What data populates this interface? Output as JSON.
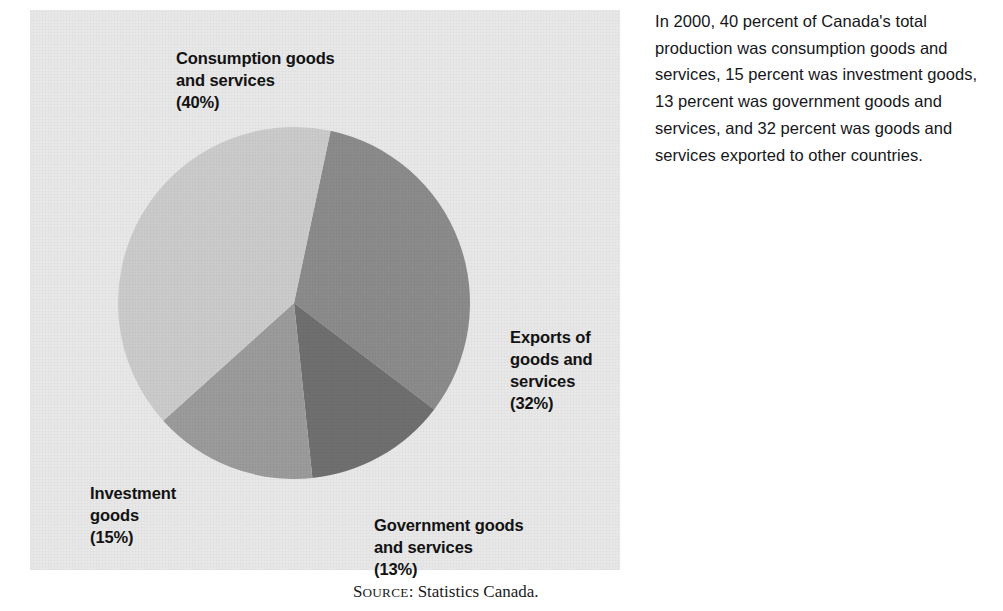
{
  "figure": {
    "background_color": "#e8e8e8",
    "source_note": {
      "lead": "S",
      "small_caps": "OURCE",
      "rest": ": Statistics Canada."
    }
  },
  "chart_data": {
    "type": "pie",
    "title": "",
    "categories": [
      "Consumption goods and services",
      "Exports of goods and services",
      "Government goods and services",
      "Investment goods"
    ],
    "values": [
      40,
      32,
      13,
      15
    ],
    "unit": "percent",
    "legend_position": "callout-labels",
    "grid": false,
    "slices": [
      {
        "name": "Consumption goods and services",
        "value": 40,
        "value_label": "(40%)",
        "color": "#cbcbcb",
        "label_lines": [
          "Consumption goods",
          "and services",
          "(40%)"
        ]
      },
      {
        "name": "Exports of goods and services",
        "value": 32,
        "value_label": "(32%)",
        "color": "#8b8b8b",
        "label_lines": [
          "Exports of",
          "goods and",
          "services",
          "(32%)"
        ]
      },
      {
        "name": "Government goods and services",
        "value": 13,
        "value_label": "(13%)",
        "color": "#6f6f6f",
        "label_lines": [
          "Government goods",
          "and services",
          "(13%)"
        ]
      },
      {
        "name": "Investment goods",
        "value": 15,
        "value_label": "(15%)",
        "color": "#9b9b9b",
        "label_lines": [
          "Investment",
          "goods",
          "(15%)"
        ]
      }
    ],
    "labels": {
      "consumption": "Consumption goods\nand services\n(40%)",
      "exports": "Exports of\ngoods and\nservices\n(32%)",
      "government": "Government goods\nand services\n(13%)",
      "investment": "Investment\ngoods\n(15%)"
    }
  },
  "caption": {
    "body": "In 2000, 40 percent of Canada's total production was consumption goods and services, 15 percent was investment goods, 13 percent was government goods and services, and 32 percent was goods and services exported to other countries."
  }
}
